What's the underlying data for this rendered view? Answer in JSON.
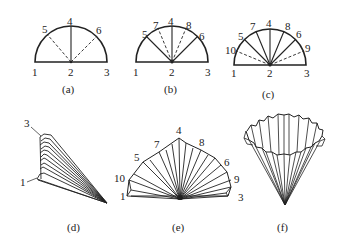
{
  "figure": {
    "panels": [
      {
        "id": "a",
        "caption": "(a)",
        "points": {
          "p1": "1",
          "p2": "2",
          "p3": "3",
          "p4": "4",
          "p5": "5",
          "p6": "6"
        },
        "description": "Semicircle with center 2, solid radius 2-4, dashed radii 2-5 and 2-6"
      },
      {
        "id": "b",
        "caption": "(b)",
        "points": {
          "p1": "1",
          "p2": "2",
          "p3": "3",
          "p4": "4",
          "p5": "5",
          "p6": "6",
          "p7": "7",
          "p8": "8"
        },
        "description": "Semicircle with solid radii 2-5, 2-4, 2-6 and dashed radii 2-7, 2-8"
      },
      {
        "id": "c",
        "caption": "(c)",
        "points": {
          "p1": "1",
          "p2": "2",
          "p3": "3",
          "p4": "4",
          "p5": "5",
          "p6": "6",
          "p7": "7",
          "p8": "8",
          "p9": "9",
          "p10": "10"
        },
        "description": "Semicircle with solid radii 2-5,2-7,2-4,2-8,2-6 and dashed radii 2-10, 2-9"
      },
      {
        "id": "d",
        "caption": "(d)",
        "points": {
          "p3": "3",
          "p1": "1"
        },
        "description": "Folded pleated fan, edges 3 and 1 marked"
      },
      {
        "id": "e",
        "caption": "(e)",
        "points": {
          "p1": "1",
          "p10": "10",
          "p5": "5",
          "p7": "7",
          "p4": "4",
          "p8": "8",
          "p6": "6",
          "p9": "9",
          "p3": "3"
        },
        "description": "Unfolded pleated semicircle fan"
      },
      {
        "id": "f",
        "caption": "(f)",
        "description": "Pleated fan rolled into a cone / filter cup"
      }
    ]
  }
}
